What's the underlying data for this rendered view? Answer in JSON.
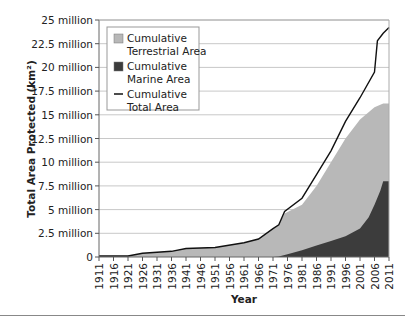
{
  "chart_data": {
    "type": "area",
    "title": "",
    "xlabel": "Year",
    "ylabel": "Total Area Protected (km²)",
    "ylim": [
      0,
      25000000
    ],
    "xlim": [
      1911,
      2011
    ],
    "grid": true,
    "legend_position": "upper-left",
    "y_ticks": [
      "0",
      "2.5 million",
      "5 million",
      "7.5 million",
      "10 million",
      "12.5 million",
      "15 million",
      "17.5 million",
      "20 million",
      "22.5 million",
      "25 million"
    ],
    "x_ticks": [
      "1911",
      "1916",
      "1921",
      "1926",
      "1931",
      "1936",
      "1941",
      "1946",
      "1951",
      "1956",
      "1961",
      "1966",
      "1971",
      "1976",
      "1981",
      "1986",
      "1991",
      "1996",
      "2001",
      "2006",
      "2011"
    ],
    "legend": [
      {
        "label_line1": "Cumulative",
        "label_line2": "Terrestrial Area",
        "swatch": "area",
        "color": "#b8b8b8"
      },
      {
        "label_line1": "Cumulative",
        "label_line2": "Marine Area",
        "swatch": "area",
        "color": "#3c3c3c"
      },
      {
        "label_line1": "Cumulative",
        "label_line2": "Total Area",
        "swatch": "line",
        "color": "#111111"
      }
    ],
    "series": [
      {
        "name": "Cumulative Terrestrial Area",
        "x": [
          1911,
          1921,
          1926,
          1936,
          1941,
          1951,
          1961,
          1966,
          1971,
          1973,
          1975,
          1981,
          1986,
          1991,
          1996,
          2001,
          2006,
          2009,
          2011
        ],
        "values": [
          0.1,
          0.1,
          0.4,
          0.6,
          0.9,
          1.0,
          1.5,
          1.9,
          3.0,
          3.4,
          4.6,
          5.5,
          7.5,
          10.0,
          12.5,
          14.5,
          15.8,
          16.2,
          16.2
        ],
        "unit": "million km²"
      },
      {
        "name": "Cumulative Marine Area",
        "x": [
          1911,
          1971,
          1973,
          1976,
          1981,
          1986,
          1991,
          1996,
          2001,
          2004,
          2006,
          2008,
          2009,
          2011
        ],
        "values": [
          0,
          0,
          0.05,
          0.3,
          0.7,
          1.2,
          1.7,
          2.2,
          3.0,
          4.2,
          5.5,
          7.0,
          8.0,
          8.0
        ],
        "unit": "million km²"
      },
      {
        "name": "Cumulative Total Area",
        "x": [
          1911,
          1921,
          1926,
          1936,
          1941,
          1951,
          1961,
          1966,
          1971,
          1973,
          1975,
          1981,
          1986,
          1991,
          1996,
          2001,
          2006,
          2007,
          2009,
          2011
        ],
        "values": [
          0.1,
          0.1,
          0.4,
          0.6,
          0.9,
          1.0,
          1.5,
          1.9,
          3.0,
          3.4,
          4.8,
          6.2,
          8.7,
          11.2,
          14.3,
          16.8,
          19.5,
          22.8,
          23.6,
          24.2
        ],
        "unit": "million km²"
      }
    ]
  }
}
